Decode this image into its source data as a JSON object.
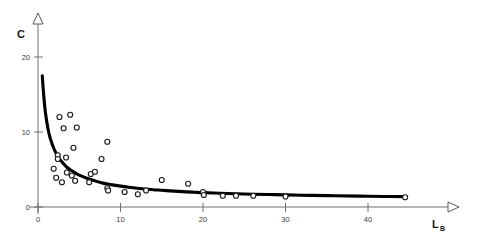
{
  "chart_data": {
    "type": "scatter",
    "title": "",
    "subtitle": "",
    "xlabel": "L",
    "xlabel_subscript": "B",
    "ylabel": "C",
    "ylabel_subscript": "",
    "xlim": [
      0,
      45.5
    ],
    "ylim": [
      0,
      24
    ],
    "xticks": [
      0,
      10,
      20,
      30,
      40
    ],
    "xticklabels": [
      "0",
      "10",
      "20",
      "30",
      "40"
    ],
    "yticks": [
      0,
      10,
      20
    ],
    "yticklabels": [
      "0",
      "10",
      "20"
    ],
    "grid": false,
    "legend": null,
    "legend_position": "none",
    "axis_arrows": true,
    "marker": "open-circle",
    "marker_color": "#ffffff",
    "marker_edge_color": "#1c1c1c",
    "curve_color": "#000000",
    "axis_color": "#6e6e6e",
    "series": [
      {
        "name": "observations",
        "type": "scatter",
        "points": [
          [
            2.6,
            12.0
          ],
          [
            3.9,
            12.3
          ],
          [
            3.1,
            10.5
          ],
          [
            4.7,
            10.6
          ],
          [
            4.3,
            7.9
          ],
          [
            8.4,
            8.7
          ],
          [
            2.4,
            6.9
          ],
          [
            2.4,
            6.4
          ],
          [
            3.4,
            6.6
          ],
          [
            7.7,
            6.4
          ],
          [
            1.9,
            5.1
          ],
          [
            3.5,
            4.6
          ],
          [
            4.1,
            4.2
          ],
          [
            6.4,
            4.4
          ],
          [
            6.9,
            4.7
          ],
          [
            2.2,
            3.9
          ],
          [
            4.5,
            3.5
          ],
          [
            2.9,
            3.3
          ],
          [
            6.2,
            3.3
          ],
          [
            15.0,
            3.6
          ],
          [
            18.2,
            3.1
          ],
          [
            8.4,
            2.5
          ],
          [
            8.5,
            2.2
          ],
          [
            10.5,
            2.0
          ],
          [
            12.1,
            1.7
          ],
          [
            13.1,
            2.2
          ],
          [
            20.0,
            2.0
          ],
          [
            20.1,
            1.6
          ],
          [
            22.4,
            1.5
          ],
          [
            24.0,
            1.5
          ],
          [
            26.1,
            1.5
          ],
          [
            30.0,
            1.4
          ],
          [
            44.5,
            1.3
          ]
        ]
      },
      {
        "name": "fitted-curve",
        "type": "line",
        "description": "hyperbolic decay fit",
        "points": [
          [
            0.52,
            17.5
          ],
          [
            0.7,
            14.8
          ],
          [
            0.9,
            12.6
          ],
          [
            1.2,
            10.5
          ],
          [
            1.5,
            9.1
          ],
          [
            2.0,
            7.6
          ],
          [
            2.5,
            6.6
          ],
          [
            3.0,
            5.9
          ],
          [
            3.5,
            5.3
          ],
          [
            4.0,
            4.9
          ],
          [
            4.5,
            4.55
          ],
          [
            5.0,
            4.25
          ],
          [
            6.0,
            3.8
          ],
          [
            7.0,
            3.45
          ],
          [
            8.0,
            3.15
          ],
          [
            9.0,
            2.95
          ],
          [
            10.0,
            2.78
          ],
          [
            11.0,
            2.63
          ],
          [
            12.0,
            2.5
          ],
          [
            13.0,
            2.4
          ],
          [
            14.0,
            2.3
          ],
          [
            15.0,
            2.23
          ],
          [
            16.0,
            2.15
          ],
          [
            17.0,
            2.08
          ],
          [
            18.0,
            2.02
          ],
          [
            19.0,
            1.97
          ],
          [
            20.0,
            1.92
          ],
          [
            22.0,
            1.84
          ],
          [
            24.0,
            1.77
          ],
          [
            26.0,
            1.71
          ],
          [
            28.0,
            1.66
          ],
          [
            30.0,
            1.62
          ],
          [
            33.0,
            1.55
          ],
          [
            36.0,
            1.5
          ],
          [
            39.0,
            1.45
          ],
          [
            42.0,
            1.41
          ],
          [
            44.5,
            1.38
          ]
        ]
      }
    ]
  }
}
